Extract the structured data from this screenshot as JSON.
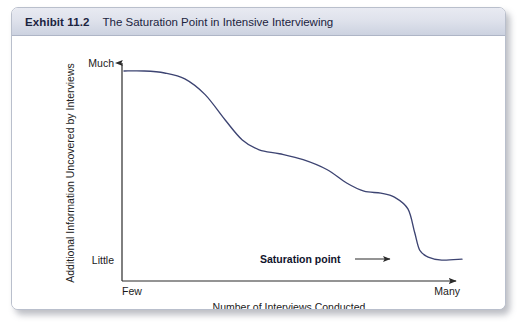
{
  "exhibit": {
    "number": "Exhibit 11.2",
    "title": "The Saturation Point in Intensive Interviewing"
  },
  "chart_data": {
    "type": "line",
    "title": "The Saturation Point in Intensive Interviewing",
    "xlabel": "Number of Interviews Conducted",
    "ylabel": "Additional Information Uncovered by Interviews",
    "x_tick_labels": [
      "Few",
      "Many"
    ],
    "y_tick_labels": [
      "Little",
      "Much"
    ],
    "xlim": [
      "Few",
      "Many"
    ],
    "ylim": [
      "Little",
      "Much"
    ],
    "grid": false,
    "legend": null,
    "line_color": "#3d4472",
    "axis_color": "#2b2b2b",
    "series": [
      {
        "name": "Additional information uncovered",
        "description": "Descending stepped curve: flat and high at few interviews, falling in two plateaus, then a sharp final drop to a low flat tail at many interviews",
        "points": [
          {
            "x": 0.0,
            "y": 1.0
          },
          {
            "x": 0.06,
            "y": 1.0
          },
          {
            "x": 0.12,
            "y": 0.99
          },
          {
            "x": 0.18,
            "y": 0.96
          },
          {
            "x": 0.24,
            "y": 0.88
          },
          {
            "x": 0.3,
            "y": 0.75
          },
          {
            "x": 0.35,
            "y": 0.65
          },
          {
            "x": 0.4,
            "y": 0.6
          },
          {
            "x": 0.46,
            "y": 0.58
          },
          {
            "x": 0.53,
            "y": 0.55
          },
          {
            "x": 0.6,
            "y": 0.5
          },
          {
            "x": 0.66,
            "y": 0.43
          },
          {
            "x": 0.71,
            "y": 0.39
          },
          {
            "x": 0.76,
            "y": 0.38
          },
          {
            "x": 0.8,
            "y": 0.36
          },
          {
            "x": 0.84,
            "y": 0.3
          },
          {
            "x": 0.86,
            "y": 0.18
          },
          {
            "x": 0.875,
            "y": 0.09
          },
          {
            "x": 0.9,
            "y": 0.055
          },
          {
            "x": 0.94,
            "y": 0.04
          },
          {
            "x": 1.0,
            "y": 0.045
          }
        ]
      }
    ],
    "annotations": [
      {
        "text": "Saturation point",
        "type": "arrow-label",
        "points_to": "curve elbow at the steep final drop",
        "arrow_direction": "right"
      }
    ]
  }
}
